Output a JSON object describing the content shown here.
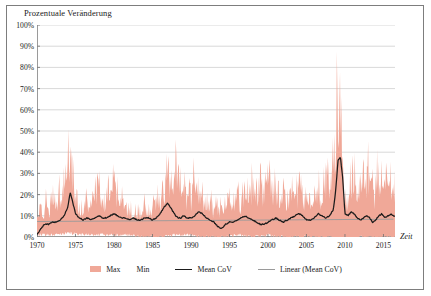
{
  "chart_data": {
    "type": "area",
    "title": "",
    "ylabel": "Prozentuale Veränderung",
    "xlabel": "Zeit",
    "grid": "horizontal",
    "legend_position": "bottom",
    "xlim": [
      1970,
      2016.5
    ],
    "ylim": [
      0,
      100
    ],
    "ytick_labels": [
      "0%",
      "10%",
      "20%",
      "30%",
      "40%",
      "50%",
      "60%",
      "70%",
      "80%",
      "90%",
      "100%"
    ],
    "ytick_values": [
      0,
      10,
      20,
      30,
      40,
      50,
      60,
      70,
      80,
      90,
      100
    ],
    "xtick_labels": [
      "1970",
      "1975",
      "1980",
      "1985",
      "1990",
      "1995",
      "2000",
      "2005",
      "2010",
      "2015"
    ],
    "xtick_values": [
      1970,
      1975,
      1980,
      1985,
      1990,
      1995,
      2000,
      2005,
      2010,
      2015
    ],
    "colors": {
      "band": "#f0a898",
      "mean": "#1b1b1b",
      "trend": "#9a9a9a"
    },
    "legend": [
      {
        "label": "Max",
        "label2": "Min",
        "marker": "area",
        "color": "#f0a898"
      },
      {
        "label": "Mean CoV",
        "marker": "line",
        "color": "#1b1b1b"
      },
      {
        "label": "Linear (Mean CoV)",
        "marker": "thin-line",
        "color": "#9a9a9a"
      }
    ],
    "series": [
      {
        "name": "Max",
        "x": [
          1970.0,
          1970.4,
          1970.8,
          1971.2,
          1971.6,
          1972.0,
          1972.4,
          1972.8,
          1973.2,
          1973.6,
          1974.0,
          1974.2,
          1974.5,
          1974.8,
          1975.1,
          1975.5,
          1976.0,
          1976.5,
          1977.0,
          1977.5,
          1978.0,
          1978.4,
          1978.8,
          1979.2,
          1979.6,
          1980.0,
          1980.4,
          1980.8,
          1981.2,
          1981.6,
          1982.0,
          1982.5,
          1983.0,
          1983.5,
          1984.0,
          1984.5,
          1985.0,
          1985.5,
          1986.0,
          1986.5,
          1987.0,
          1987.3,
          1987.6,
          1988.0,
          1988.4,
          1988.8,
          1989.2,
          1989.6,
          1990.0,
          1990.4,
          1990.8,
          1991.2,
          1991.6,
          1992.0,
          1992.5,
          1993.0,
          1993.5,
          1994.0,
          1994.5,
          1995.0,
          1995.5,
          1996.0,
          1996.5,
          1997.0,
          1997.5,
          1998.0,
          1998.5,
          1999.0,
          1999.5,
          2000.0,
          2000.5,
          2001.0,
          2001.5,
          2002.0,
          2002.5,
          2003.0,
          2003.5,
          2004.0,
          2004.4,
          2004.8,
          2005.2,
          2005.6,
          2006.0,
          2006.5,
          2007.0,
          2007.5,
          2008.0,
          2008.4,
          2008.8,
          2009.0,
          2009.2,
          2009.4,
          2009.6,
          2009.9,
          2010.2,
          2010.6,
          2011.0,
          2011.4,
          2011.8,
          2012.2,
          2012.6,
          2013.0,
          2013.4,
          2013.8,
          2014.2,
          2014.6,
          2015.0,
          2015.4,
          2015.8,
          2016.2
        ],
        "y": [
          11,
          18,
          14,
          24,
          16,
          30,
          19,
          33,
          22,
          40,
          48,
          65,
          50,
          34,
          26,
          20,
          17,
          26,
          19,
          31,
          38,
          25,
          22,
          33,
          26,
          41,
          30,
          22,
          26,
          18,
          20,
          15,
          19,
          14,
          22,
          16,
          20,
          28,
          22,
          34,
          45,
          38,
          30,
          48,
          40,
          28,
          34,
          26,
          32,
          42,
          34,
          26,
          30,
          22,
          26,
          18,
          24,
          17,
          20,
          26,
          20,
          30,
          22,
          34,
          26,
          38,
          28,
          40,
          30,
          44,
          32,
          36,
          26,
          30,
          22,
          34,
          26,
          40,
          30,
          24,
          28,
          20,
          26,
          34,
          28,
          42,
          34,
          52,
          70,
          95,
          97,
          88,
          60,
          30,
          22,
          35,
          45,
          38,
          30,
          42,
          34,
          46,
          38,
          30,
          42,
          34,
          44,
          36,
          40,
          33
        ]
      },
      {
        "name": "Min",
        "x": [
          1970.0,
          1972.0,
          1974.0,
          1976.0,
          1978.0,
          1980.0,
          1982.0,
          1984.0,
          1986.0,
          1988.0,
          1990.0,
          1992.0,
          1994.0,
          1996.0,
          1998.0,
          2000.0,
          2002.0,
          2004.0,
          2006.0,
          2008.0,
          2009.0,
          2010.0,
          2011.0,
          2012.0,
          2013.0,
          2014.0,
          2015.0,
          2016.2
        ],
        "y": [
          1,
          1,
          2,
          1,
          1,
          1,
          1,
          0,
          0,
          1,
          1,
          0,
          0,
          1,
          0,
          1,
          0,
          0,
          0,
          0,
          -1,
          -2,
          -1,
          0,
          0,
          0,
          0,
          0
        ]
      },
      {
        "name": "Mean CoV",
        "x": [
          1970.0,
          1970.5,
          1971.0,
          1971.5,
          1972.0,
          1972.5,
          1973.0,
          1973.5,
          1974.0,
          1974.3,
          1974.6,
          1975.0,
          1975.5,
          1976.0,
          1976.5,
          1977.0,
          1977.5,
          1978.0,
          1978.5,
          1979.0,
          1979.5,
          1980.0,
          1980.5,
          1981.0,
          1981.5,
          1982.0,
          1982.5,
          1983.0,
          1983.5,
          1984.0,
          1984.5,
          1985.0,
          1985.5,
          1986.0,
          1986.5,
          1987.0,
          1987.5,
          1988.0,
          1988.3,
          1988.7,
          1989.0,
          1989.5,
          1990.0,
          1990.5,
          1991.0,
          1991.5,
          1992.0,
          1992.5,
          1993.0,
          1993.5,
          1994.0,
          1994.5,
          1995.0,
          1995.5,
          1996.0,
          1996.5,
          1997.0,
          1997.5,
          1998.0,
          1998.5,
          1999.0,
          1999.5,
          2000.0,
          2000.5,
          2001.0,
          2001.5,
          2002.0,
          2002.5,
          2003.0,
          2003.5,
          2004.0,
          2004.5,
          2005.0,
          2005.5,
          2006.0,
          2006.5,
          2007.0,
          2007.5,
          2008.0,
          2008.5,
          2008.8,
          2009.1,
          2009.4,
          2009.7,
          2010.0,
          2010.4,
          2010.8,
          2011.2,
          2011.6,
          2012.0,
          2012.4,
          2012.8,
          2013.2,
          2013.6,
          2014.0,
          2014.4,
          2014.8,
          2015.2,
          2015.6,
          2016.0,
          2016.3
        ],
        "y": [
          1,
          4,
          6,
          6,
          7,
          7,
          8,
          10,
          14,
          21,
          17,
          11,
          9,
          8,
          9,
          8,
          9,
          10,
          9,
          9,
          10,
          11,
          10,
          9,
          9,
          8,
          9,
          8,
          8,
          9,
          9,
          8,
          9,
          11,
          14,
          16,
          13,
          10,
          9,
          9,
          10,
          9,
          9,
          10,
          12,
          11,
          9,
          8,
          7,
          5,
          4,
          6,
          7,
          7,
          8,
          9,
          10,
          9,
          8,
          7,
          6,
          6,
          7,
          8,
          9,
          8,
          7,
          8,
          9,
          10,
          11,
          10,
          8,
          8,
          9,
          11,
          10,
          9,
          10,
          13,
          22,
          36,
          38,
          28,
          11,
          10,
          12,
          11,
          9,
          8,
          9,
          10,
          9,
          7,
          8,
          10,
          11,
          9,
          10,
          11,
          10
        ]
      },
      {
        "name": "Linear (Mean CoV)",
        "x": [
          1970.0,
          2016.3
        ],
        "y": [
          7.3,
          8.4
        ]
      }
    ]
  }
}
